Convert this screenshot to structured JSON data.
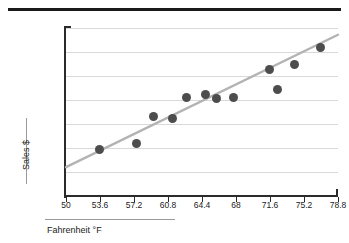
{
  "figure": {
    "top_rule": "horizontal-rule",
    "background": "#ffffff"
  },
  "chart_data": {
    "type": "scatter",
    "title": "",
    "xlabel": "Fahrenheit  °F",
    "ylabel": "Sales $",
    "xlim": [
      50,
      78.8
    ],
    "ylim": [
      0,
      700
    ],
    "grid": true,
    "legend": "none",
    "x_ticks": [
      "50",
      "53.6",
      "57.2",
      "60.8",
      "64.4",
      "68",
      "71.6",
      "75.2",
      "78.8"
    ],
    "x_tick_values": [
      50,
      53.6,
      57.2,
      60.8,
      64.4,
      68,
      71.6,
      75.2,
      78.8
    ],
    "y_ticks": [
      "$ 700",
      "$ 600",
      "$ 500",
      "$ 400",
      "$ 300",
      "$ 200",
      "$ 100",
      "$ 0"
    ],
    "y_tick_values": [
      700,
      600,
      500,
      400,
      300,
      200,
      100,
      0
    ],
    "point_color": "#4d4d4d",
    "trendline_color": "#b3b3b3",
    "points": [
      {
        "x": 53.5,
        "y": 192
      },
      {
        "x": 57.5,
        "y": 220
      },
      {
        "x": 59.3,
        "y": 333
      },
      {
        "x": 61.3,
        "y": 325
      },
      {
        "x": 62.8,
        "y": 412
      },
      {
        "x": 64.8,
        "y": 425
      },
      {
        "x": 65.9,
        "y": 408
      },
      {
        "x": 67.7,
        "y": 412
      },
      {
        "x": 71.5,
        "y": 527
      },
      {
        "x": 72.4,
        "y": 445
      },
      {
        "x": 74.2,
        "y": 548
      },
      {
        "x": 76.9,
        "y": 620
      }
    ],
    "trendline": {
      "x_start": 50.0,
      "y_start": 120,
      "x_end": 78.8,
      "y_end": 672
    }
  }
}
